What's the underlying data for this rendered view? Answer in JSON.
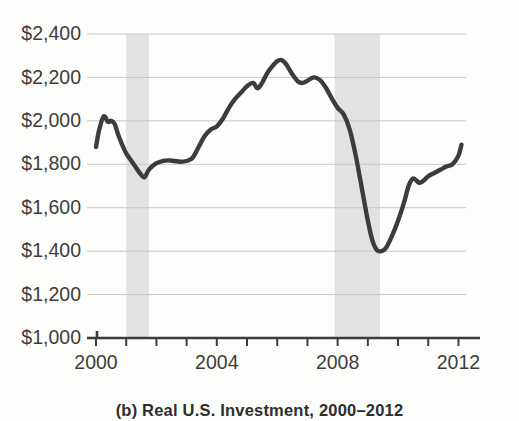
{
  "caption": "(b) Real U.S. Investment, 2000–2012",
  "colors": {
    "line": "#3c3c3c",
    "gridline": "#c8c8c8",
    "axis": "#3c3c3c",
    "recession_band": "#e2e2e2",
    "text": "#3d3d3d",
    "background": "#fdfdfc"
  },
  "chart_data": {
    "type": "line",
    "title": "(b) Real U.S. Investment, 2000–2012",
    "xlabel": "",
    "ylabel": "",
    "xlim": [
      2000,
      2012.25
    ],
    "ylim": [
      1000,
      2400
    ],
    "grid": true,
    "legend": "none",
    "y_tick_labels": [
      "$2,400",
      "$2,200",
      "$2,000",
      "$1,800",
      "$1,600",
      "$1,400",
      "$1,200",
      "$1,000"
    ],
    "y_tick_values": [
      2400,
      2200,
      2000,
      1800,
      1600,
      1400,
      1200,
      1000
    ],
    "x_tick_values": [
      2000,
      2001,
      2002,
      2003,
      2004,
      2005,
      2006,
      2007,
      2008,
      2009,
      2010,
      2011,
      2012
    ],
    "x_tick_labels_shown": [
      "2000",
      "2004",
      "2008",
      "2012"
    ],
    "x_tick_labels_shown_values": [
      2000,
      2004,
      2008,
      2012
    ],
    "units": "Billions of 2009 dollars",
    "recession_bands": [
      {
        "start": 2001.0,
        "end": 2001.75
      },
      {
        "start": 2007.9,
        "end": 2009.4
      }
    ],
    "series": [
      {
        "name": "Real U.S. Investment",
        "x": [
          2000.0,
          2000.1,
          2000.25,
          2000.4,
          2000.5,
          2000.62,
          2000.75,
          2000.9,
          2001.0,
          2001.15,
          2001.3,
          2001.45,
          2001.6,
          2001.75,
          2001.9,
          2002.0,
          2002.2,
          2002.4,
          2002.6,
          2002.8,
          2003.0,
          2003.2,
          2003.4,
          2003.6,
          2003.8,
          2004.0,
          2004.2,
          2004.4,
          2004.6,
          2004.8,
          2005.0,
          2005.2,
          2005.35,
          2005.5,
          2005.65,
          2005.8,
          2006.0,
          2006.15,
          2006.3,
          2006.5,
          2006.7,
          2006.85,
          2007.0,
          2007.2,
          2007.4,
          2007.6,
          2007.8,
          2008.0,
          2008.2,
          2008.4,
          2008.6,
          2008.8,
          2009.0,
          2009.15,
          2009.3,
          2009.45,
          2009.6,
          2009.8,
          2010.0,
          2010.2,
          2010.35,
          2010.5,
          2010.7,
          2010.85,
          2011.0,
          2011.2,
          2011.4,
          2011.6,
          2011.8,
          2012.0,
          2012.1
        ],
        "y": [
          1880,
          1955,
          2020,
          1995,
          2000,
          1985,
          1930,
          1880,
          1850,
          1820,
          1790,
          1760,
          1740,
          1775,
          1795,
          1805,
          1815,
          1818,
          1815,
          1812,
          1815,
          1830,
          1880,
          1930,
          1960,
          1975,
          2010,
          2060,
          2100,
          2130,
          2160,
          2175,
          2150,
          2175,
          2215,
          2245,
          2275,
          2280,
          2260,
          2215,
          2180,
          2175,
          2185,
          2200,
          2190,
          2155,
          2105,
          2060,
          2030,
          1960,
          1840,
          1690,
          1540,
          1450,
          1405,
          1400,
          1415,
          1470,
          1540,
          1625,
          1700,
          1735,
          1715,
          1725,
          1745,
          1760,
          1775,
          1790,
          1800,
          1840,
          1890
        ]
      }
    ],
    "annotations": {
      "start_value": 1880,
      "first_trough": {
        "x": 2001.6,
        "y": 1740
      },
      "peak": {
        "x": 2006.15,
        "y": 2280
      },
      "crisis_trough": {
        "x": 2009.45,
        "y": 1400
      },
      "end_value": 1890
    }
  }
}
